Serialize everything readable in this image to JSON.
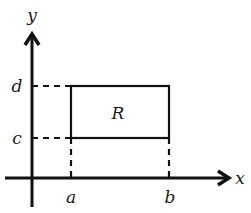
{
  "diagram": {
    "title": "",
    "axes": {
      "x_label": "x",
      "y_label": "y"
    },
    "ticks": {
      "x": [
        "a",
        "b"
      ],
      "y": [
        "c",
        "d"
      ]
    },
    "region": {
      "label": "R",
      "description": "rectangle a ≤ x ≤ b, c ≤ y ≤ d"
    },
    "colors": {
      "stroke": "#111111",
      "background": "#ffffff"
    }
  }
}
